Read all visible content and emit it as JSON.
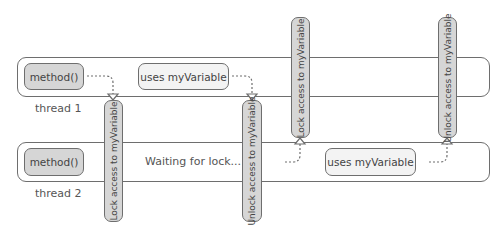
{
  "threads": [
    {
      "label": "thread 1",
      "steps": [
        "method()",
        "uses myVariable"
      ]
    },
    {
      "label": "thread 2",
      "steps": [
        "method()",
        "Waiting for lock...",
        "uses myVariable"
      ]
    }
  ],
  "bars": [
    {
      "label": "Lock access to myVariable",
      "thread": "thread 1"
    },
    {
      "label": "Unlock access to myVariable",
      "thread": "thread 1"
    },
    {
      "label": "Lock access to myVariable",
      "thread": "thread 2"
    },
    {
      "label": "Unlock access to myVariable",
      "thread": "thread 2"
    }
  ],
  "colors": {
    "stroke": "#6e6e6e",
    "dark_fill": "#d6d6d6",
    "light_fill": "#f3f3f3",
    "text": "#444444"
  }
}
